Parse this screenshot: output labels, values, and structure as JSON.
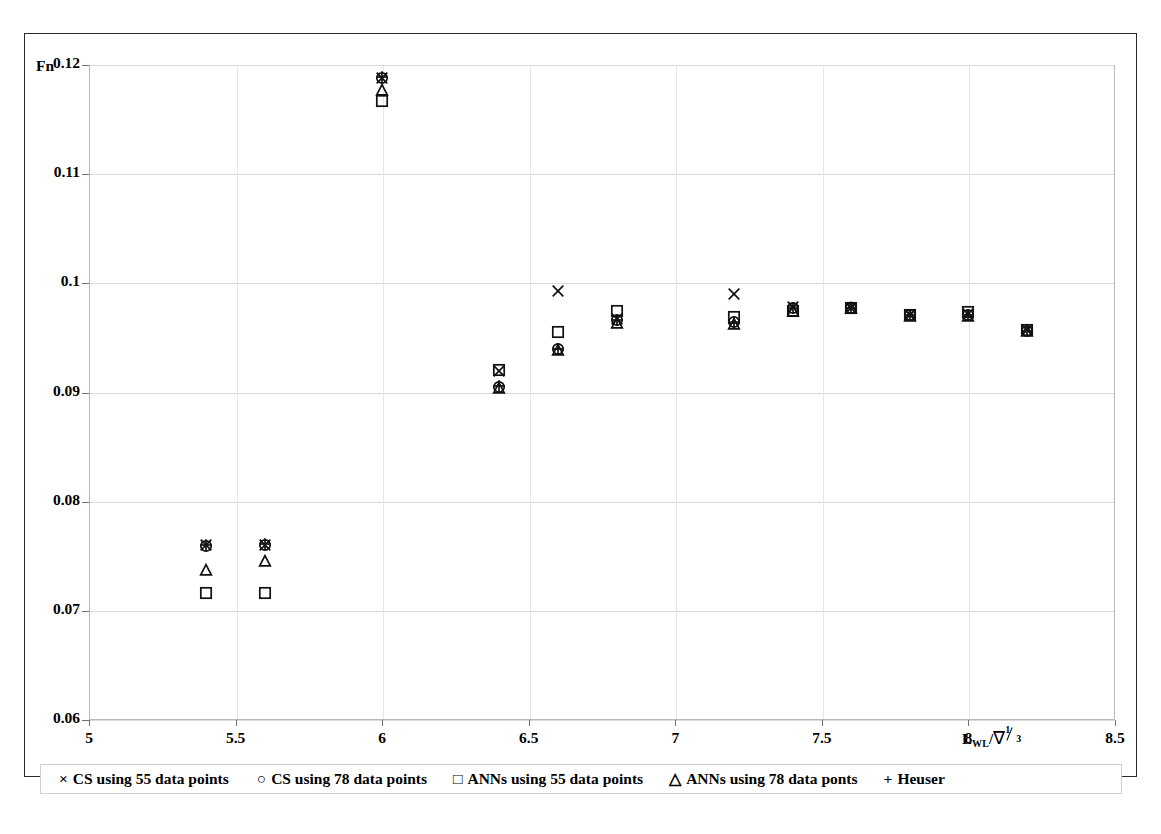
{
  "figure": {
    "y_axis_title": "Fn",
    "x_axis_title_parts": {
      "base": "L",
      "subscript": "WL",
      "slash": "/",
      "nabla": "∇",
      "exp_num": "1",
      "exp_den": "3"
    }
  },
  "legend": {
    "items": [
      {
        "glyph": "×",
        "marker": "cross-x",
        "label": "CS  using 55 data points"
      },
      {
        "glyph": "○",
        "marker": "circle",
        "label": "CS using 78 data points"
      },
      {
        "glyph": "□",
        "marker": "square",
        "label": "ANNs using 55 data points"
      },
      {
        "glyph": "△",
        "marker": "triangle",
        "label": "ANNs using 78 data ponts"
      },
      {
        "glyph": "+",
        "marker": "plus",
        "label": "Heuser"
      }
    ]
  },
  "chart_data": {
    "type": "scatter",
    "title": "",
    "xlabel": "L_WL / ∇^(1/3)",
    "ylabel": "Fn",
    "xlim": [
      5,
      8.5
    ],
    "ylim": [
      0.06,
      0.12
    ],
    "xticks": [
      "5",
      "5.5",
      "6",
      "6.5",
      "7",
      "7.5",
      "8",
      "8.5"
    ],
    "xtick_values": [
      5,
      5.5,
      6,
      6.5,
      7,
      7.5,
      8,
      8.5
    ],
    "yticks": [
      "0.06",
      "0.07",
      "0.08",
      "0.09",
      "0.1",
      "0.11",
      "0.12"
    ],
    "ytick_values": [
      0.06,
      0.07,
      0.08,
      0.09,
      0.1,
      0.11,
      0.12
    ],
    "grid": true,
    "legend_position": "below-axis",
    "x": [
      5.4,
      5.6,
      6.0,
      6.4,
      6.6,
      6.8,
      7.2,
      7.4,
      7.6,
      7.8,
      8.0,
      8.2
    ],
    "series": [
      {
        "name": "CS  using 55 data points",
        "marker": "cross-x",
        "values": [
          0.076,
          0.076,
          0.1188,
          0.092,
          0.0993,
          0.0967,
          0.099,
          0.0978,
          0.0977,
          0.0971,
          0.0972,
          0.0957
        ]
      },
      {
        "name": "CS using 78 data points",
        "marker": "circle",
        "values": [
          0.0759,
          0.076,
          0.1188,
          0.0905,
          0.094,
          0.0966,
          0.0965,
          0.0977,
          0.0977,
          0.0971,
          0.0971,
          0.0956
        ]
      },
      {
        "name": "ANNs using 55 data points",
        "marker": "square",
        "values": [
          0.0716,
          0.0716,
          0.1167,
          0.0921,
          0.0955,
          0.0975,
          0.0969,
          0.0975,
          0.0977,
          0.0971,
          0.0974,
          0.0957
        ]
      },
      {
        "name": "ANNs using 78 data ponts",
        "marker": "triangle",
        "values": [
          0.0737,
          0.0746,
          0.1177,
          0.0904,
          0.0939,
          0.0964,
          0.0963,
          0.0975,
          0.0977,
          0.097,
          0.097,
          0.0956
        ]
      },
      {
        "name": "Heuser",
        "marker": "plus",
        "values": [
          0.076,
          0.0761,
          0.1189,
          0.0906,
          0.094,
          0.0966,
          0.0964,
          0.0977,
          0.0977,
          0.0971,
          0.0971,
          0.0956
        ]
      }
    ]
  }
}
